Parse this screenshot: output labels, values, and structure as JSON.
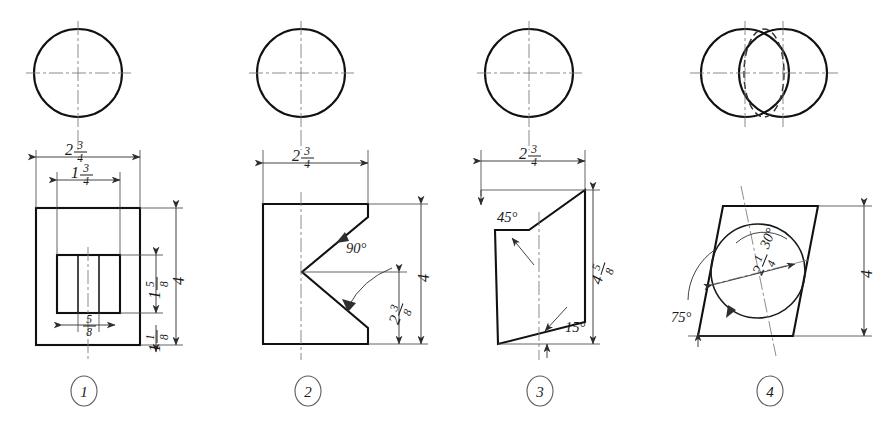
{
  "sheet": {
    "title": "Orthographic projection exercise sheet",
    "background_color": "#ffffff",
    "ink_color": "#111111",
    "figure_count": 4
  },
  "figures": [
    {
      "id": "figure-1",
      "number": "1",
      "top_view": "circle with center lines",
      "front_view": "rectangle with inner slotted rectangle",
      "dimensions": [
        {
          "name": "overall-width",
          "whole": "2",
          "num": "3",
          "den": "4",
          "text": "2 3/4",
          "orientation": "horizontal",
          "position": "top"
        },
        {
          "name": "inner-width",
          "whole": "1",
          "num": "3",
          "den": "4",
          "text": "1 3/4",
          "orientation": "horizontal",
          "position": "top"
        },
        {
          "name": "slot-width",
          "whole": "",
          "num": "5",
          "den": "8",
          "text": "5/8",
          "orientation": "horizontal",
          "position": "bottom"
        },
        {
          "name": "overall-height",
          "whole": "4",
          "num": "",
          "den": "",
          "text": "4",
          "orientation": "vertical",
          "position": "right"
        },
        {
          "name": "slot-height",
          "whole": "1",
          "num": "5",
          "den": "8",
          "text": "1 5/8",
          "orientation": "vertical",
          "position": "right"
        },
        {
          "name": "base-offset",
          "whole": "1",
          "num": "1",
          "den": "8",
          "text": "1 1/8",
          "orientation": "vertical",
          "position": "right"
        }
      ],
      "angles": []
    },
    {
      "id": "figure-2",
      "number": "2",
      "top_view": "circle with center lines",
      "front_view": "rectangle with V notch cut from right side",
      "dimensions": [
        {
          "name": "overall-width",
          "whole": "2",
          "num": "3",
          "den": "4",
          "text": "2 3/4",
          "orientation": "horizontal",
          "position": "top"
        },
        {
          "name": "overall-height",
          "whole": "4",
          "num": "",
          "den": "",
          "text": "4",
          "orientation": "vertical",
          "position": "right"
        },
        {
          "name": "notch-height",
          "whole": "2",
          "num": "3",
          "den": "8",
          "text": "2 3/8",
          "orientation": "vertical",
          "position": "right"
        }
      ],
      "angles": [
        {
          "name": "notch-angle",
          "text": "90°",
          "value": 90
        }
      ]
    },
    {
      "id": "figure-3",
      "number": "3",
      "top_view": "circle with center lines",
      "front_view": "irregular quadrilateral with inclined top and bottom faces",
      "dimensions": [
        {
          "name": "overall-width",
          "whole": "2",
          "num": "3",
          "den": "4",
          "text": "2 3/4",
          "orientation": "horizontal",
          "position": "top"
        },
        {
          "name": "overall-height",
          "whole": "4",
          "num": "5",
          "den": "8",
          "text": "4 5/8",
          "orientation": "vertical",
          "position": "right"
        }
      ],
      "angles": [
        {
          "name": "top-bevel-angle",
          "text": "45°",
          "value": 45
        },
        {
          "name": "bottom-bevel-angle",
          "text": "15°",
          "value": 15
        }
      ]
    },
    {
      "id": "figure-4",
      "number": "4",
      "top_view": "two overlapping circles with dashed ellipse",
      "front_view": "parallelogram with inscribed circle",
      "dimensions": [
        {
          "name": "overall-height",
          "whole": "4",
          "num": "",
          "den": "",
          "text": "4",
          "orientation": "vertical",
          "position": "right"
        },
        {
          "name": "circle-diameter",
          "whole": "2",
          "num": "1",
          "den": "4",
          "text": "2 1/4",
          "orientation": "inclined",
          "position": "center"
        }
      ],
      "angles": [
        {
          "name": "slant-angle",
          "text": "75°",
          "value": 75
        },
        {
          "name": "diameter-angle",
          "text": "30°",
          "value": 30
        }
      ]
    }
  ]
}
